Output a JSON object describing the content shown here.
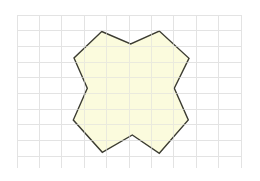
{
  "canvas": {
    "width": 260,
    "height": 181,
    "background_color": "#ffffff",
    "name": "geometry-figure"
  },
  "grid": {
    "visible": true,
    "line_color": "#e3e3e3",
    "line_width": 1,
    "x_start": 17,
    "x_end": 242,
    "y_start": 15,
    "y_end": 168,
    "x_spacing": 22.4,
    "y_spacing": 15.7,
    "vertical_count": 11,
    "horizontal_count": 11
  },
  "shape": {
    "name": "four-pointed-star-polygon",
    "type": "polygon",
    "vertex_count": 12,
    "fill_color": "#fafad2",
    "fill_opacity": 0.75,
    "stroke_color": "#3c3c32",
    "stroke_width": 1.4,
    "points": [
      [
        101.7,
        31.5
      ],
      [
        130.7,
        44.0
      ],
      [
        159.3,
        31.0
      ],
      [
        189.0,
        58.3
      ],
      [
        174.3,
        88.3
      ],
      [
        188.3,
        120.0
      ],
      [
        159.3,
        153.3
      ],
      [
        132.3,
        135.0
      ],
      [
        102.3,
        152.3
      ],
      [
        73.3,
        120.0
      ],
      [
        87.3,
        88.3
      ],
      [
        74.0,
        58.0
      ]
    ],
    "points_attr": "101.7,31.5 130.7,44.0 159.3,31.0 189.0,58.3 174.3,88.3 188.3,120.0 159.3,153.3 132.3,135.0 102.3,152.3 73.3,120.0 87.3,88.3 74.0,58.0"
  }
}
